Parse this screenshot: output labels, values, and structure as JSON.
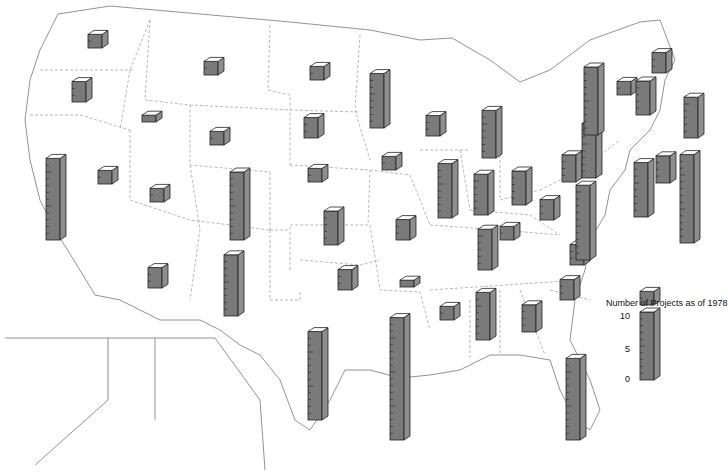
{
  "chart_data": {
    "type": "bar",
    "subtype": "3d-bar-map",
    "title": "",
    "legend": {
      "title": "Number of Projects as of 1978",
      "ticks": [
        "0",
        "5",
        "10"
      ],
      "range": [
        0,
        10
      ],
      "placement": "right"
    },
    "colors": {
      "bar_front": "#7a7a7a",
      "bar_side": "#8e8e8e",
      "bar_top": "#ffffff",
      "outline": "#222222",
      "border": "#777777"
    },
    "categories": [
      "WA",
      "OR",
      "CA",
      "ID",
      "NV",
      "MT",
      "WY",
      "UT",
      "CO",
      "AZ",
      "NM",
      "ND",
      "SD",
      "NE",
      "KS",
      "OK",
      "TX",
      "MN",
      "IA",
      "MO",
      "AR",
      "LA",
      "WI",
      "IL",
      "MI",
      "IN",
      "OH",
      "KY",
      "TN",
      "MS",
      "AL",
      "GA",
      "FL",
      "SC",
      "NC",
      "VA",
      "WV",
      "PA",
      "NY",
      "VT",
      "NH",
      "ME",
      "MA",
      "CT",
      "RI",
      "NJ",
      "DE",
      "MD"
    ],
    "values": [
      2,
      3,
      12,
      1,
      2,
      2,
      2,
      2,
      10,
      3,
      9,
      2,
      3,
      2,
      5,
      3,
      13,
      8,
      2,
      3,
      1,
      18,
      3,
      8,
      7,
      6,
      5,
      2,
      6,
      2,
      7,
      4,
      12,
      3,
      3,
      3,
      4,
      8,
      10,
      2,
      5,
      3,
      6,
      4,
      13,
      8,
      2,
      11
    ],
    "annotations": [
      "Hawaii",
      "Alaska"
    ]
  }
}
